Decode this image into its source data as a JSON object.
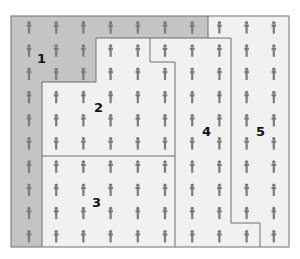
{
  "diagram": {
    "type": "zoned population grid",
    "grid": {
      "rows": 10,
      "cols": 10,
      "icon": "person-icon"
    },
    "colors": {
      "zone1_fill": "#c4c4c4",
      "other_fill": "#f1f1f1",
      "border": "#6e6e6e",
      "icon": "#7a7a7a"
    },
    "zones": [
      {
        "id": 1,
        "label": "1"
      },
      {
        "id": 2,
        "label": "2"
      },
      {
        "id": 3,
        "label": "3"
      },
      {
        "id": 4,
        "label": "4"
      },
      {
        "id": 5,
        "label": "5"
      }
    ]
  }
}
